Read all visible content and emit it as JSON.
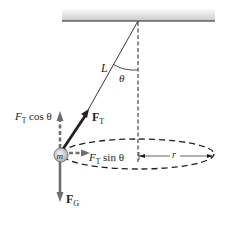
{
  "figure": {
    "type": "conical-pendulum-free-body-diagram",
    "labels": {
      "length": "L",
      "angle": "θ",
      "tension": "F",
      "tension_sub": "T",
      "tension_vertical_main": "F",
      "tension_vertical_sub": "T",
      "tension_vertical_rest": " cos θ",
      "tension_horizontal_main": "F",
      "tension_horizontal_sub": "T",
      "tension_horizontal_rest": " sin θ",
      "gravity": "F",
      "gravity_sub": "G",
      "mass": "m",
      "radius": "r"
    },
    "colors": {
      "ink": "#231f20",
      "arrow_gray": "#6d6e71",
      "ceiling_top": "#ffffff",
      "ceiling_bottom": "#c9cacc",
      "mass_fill": "#d1d3d4"
    }
  }
}
